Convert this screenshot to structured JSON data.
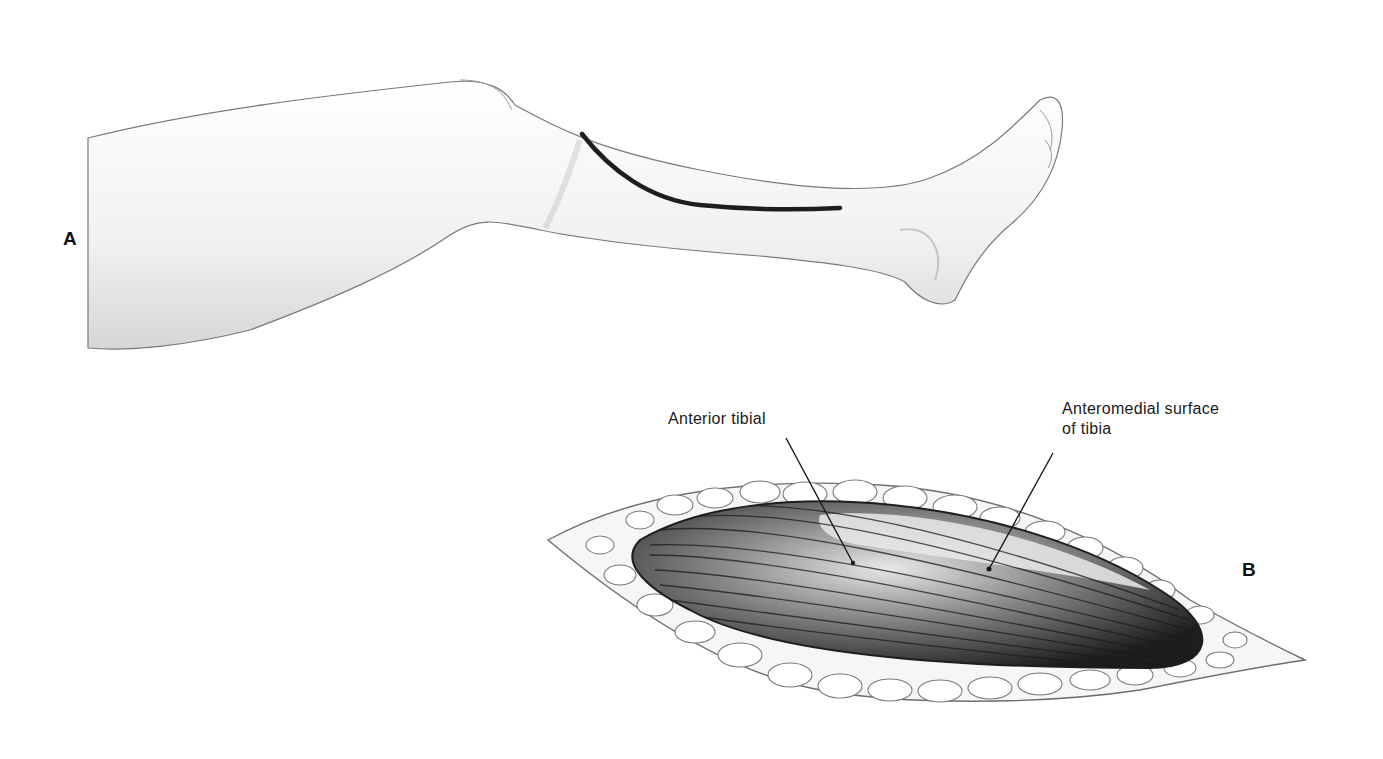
{
  "figure": {
    "panels": [
      {
        "id": "A",
        "label": "A",
        "description": "Lateral view of lower leg with anterolateral skin incision line"
      },
      {
        "id": "B",
        "label": "B",
        "description": "Exposure through incision showing muscle beneath subcutaneous fat"
      }
    ],
    "callouts": [
      {
        "text": "Anterior tibial"
      },
      {
        "line1": "Anteromedial surface",
        "line2": "of tibia"
      }
    ],
    "colors": {
      "ink": "#1a1a1a",
      "skin_shade": "#d9d9d9",
      "muscle_dark": "#2b2b2b",
      "fat_outline": "#6e6e6e",
      "background": "#ffffff"
    }
  }
}
